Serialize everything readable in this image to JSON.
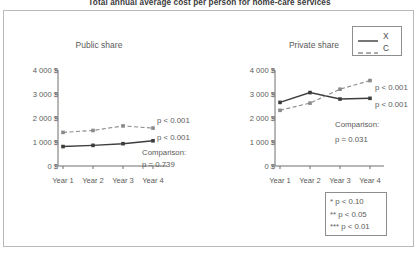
{
  "figure": {
    "title": "Total annual average cost per person for home-care services"
  },
  "legend": {
    "entries": [
      {
        "label": "X",
        "style": "solid"
      },
      {
        "label": "C",
        "style": "dashed"
      }
    ]
  },
  "footnote": {
    "lines": [
      "* p < 0.10",
      "** p < 0.05",
      "*** p < 0.01"
    ]
  },
  "chart_data": [
    {
      "type": "line",
      "title": "Public share",
      "xlabel": "",
      "ylabel": "",
      "categories": [
        "Year 1",
        "Year 2",
        "Year 3",
        "Year 4"
      ],
      "ytick_labels": [
        "0 $",
        "1 000 $",
        "2 000 $",
        "3 000 $",
        "4 000 $"
      ],
      "ytick_values": [
        0,
        1000,
        2000,
        3000,
        4000
      ],
      "ylim": [
        0,
        4000
      ],
      "grid": false,
      "legend_position": "external-top-right",
      "series": [
        {
          "name": "X",
          "style": "solid",
          "values": [
            810,
            860,
            930,
            1050
          ]
        },
        {
          "name": "C",
          "style": "dashed",
          "values": [
            1400,
            1480,
            1670,
            1580
          ]
        }
      ],
      "annotations": [
        {
          "text": "p < 0.001",
          "series": "C"
        },
        {
          "text": "p < 0.001",
          "series": "X"
        },
        {
          "text": "Comparison:"
        },
        {
          "text": "p = 0.739"
        }
      ]
    },
    {
      "type": "line",
      "title": "Private share",
      "xlabel": "",
      "ylabel": "",
      "categories": [
        "Year 1",
        "Year 2",
        "Year 3",
        "Year 4"
      ],
      "ytick_labels": [
        "0 $",
        "1 000 $",
        "2 000 $",
        "3 000 $",
        "4 000 $"
      ],
      "ytick_values": [
        0,
        1000,
        2000,
        3000,
        4000
      ],
      "ylim": [
        0,
        4000
      ],
      "grid": false,
      "legend_position": "external-top-right",
      "series": [
        {
          "name": "X",
          "style": "solid",
          "values": [
            2650,
            3060,
            2790,
            2820
          ]
        },
        {
          "name": "C",
          "style": "dashed",
          "values": [
            2320,
            2620,
            3200,
            3560
          ]
        }
      ],
      "annotations": [
        {
          "text": "p < 0.001",
          "series": "C"
        },
        {
          "text": "p < 0.001",
          "series": "X"
        },
        {
          "text": "Comparison:"
        },
        {
          "text": "p = 0.031"
        }
      ]
    }
  ],
  "colors": {
    "axis": "#6e6e6e",
    "series_x": "#3d3d3d",
    "series_c": "#8a8a8a",
    "text": "#5a5a5a",
    "frame": "#b9b9b9"
  }
}
